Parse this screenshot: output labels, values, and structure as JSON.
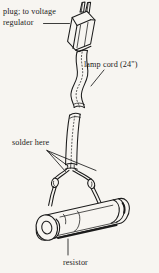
{
  "figure": {
    "background_color": "#f7f5f1",
    "ink_color": "#1b1b1b",
    "width": 159,
    "height": 273
  },
  "labels": {
    "plug_line1": "plug; to voltage",
    "plug_line2": "regulator",
    "lamp_cord": "lamp cord (24\")",
    "solder_here": "solder here",
    "resistor": "resistor"
  },
  "parts": [
    {
      "name": "plug",
      "label": "plug; to voltage regulator"
    },
    {
      "name": "lamp-cord",
      "label": "lamp cord (24\")"
    },
    {
      "name": "solder-joint",
      "label": "solder here"
    },
    {
      "name": "resistor",
      "label": "resistor"
    }
  ]
}
